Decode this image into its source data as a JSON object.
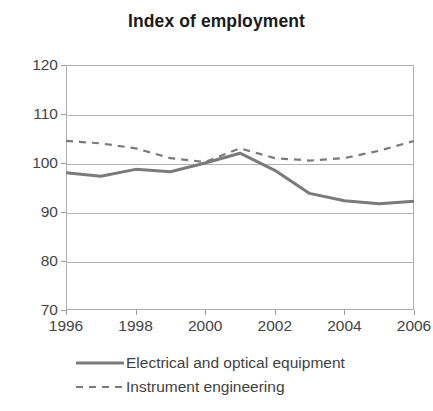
{
  "chart_data": {
    "type": "line",
    "title": "Index of employment",
    "xlabel": "",
    "ylabel": "",
    "x": [
      1996,
      1997,
      1998,
      1999,
      2000,
      2001,
      2002,
      2003,
      2004,
      2005,
      2006
    ],
    "xtick_labels": [
      "1996",
      "1998",
      "2000",
      "2002",
      "2004",
      "2006"
    ],
    "xtick_values": [
      1996,
      1998,
      2000,
      2002,
      2004,
      2006
    ],
    "ytick_labels": [
      "70",
      "80",
      "90",
      "100",
      "110",
      "120"
    ],
    "ytick_values": [
      70,
      80,
      90,
      100,
      110,
      120
    ],
    "xlim": [
      1996,
      2006
    ],
    "ylim": [
      70,
      120
    ],
    "grid": true,
    "legend_position": "bottom-left",
    "series": [
      {
        "name": "Electrical and optical equipment",
        "style": "solid",
        "color": "#7a7a7a",
        "values": [
          98.0,
          97.3,
          98.7,
          98.2,
          100.0,
          102.0,
          98.5,
          93.8,
          92.3,
          91.7,
          92.2
        ]
      },
      {
        "name": "Instrument engineering",
        "style": "dashed",
        "color": "#7a7a7a",
        "values": [
          104.5,
          104.0,
          103.0,
          101.0,
          100.2,
          103.0,
          101.0,
          100.5,
          101.0,
          102.5,
          104.5
        ]
      }
    ]
  },
  "legend": {
    "items": [
      {
        "label": "Electrical and optical equipment",
        "style": "solid"
      },
      {
        "label": "Instrument engineering",
        "style": "dashed"
      }
    ]
  },
  "colors": {
    "line": "#7a7a7a",
    "grid": "#b4b4b4",
    "frame": "#b0b0b0",
    "text": "#3b3b3b",
    "background": "#ffffff"
  }
}
